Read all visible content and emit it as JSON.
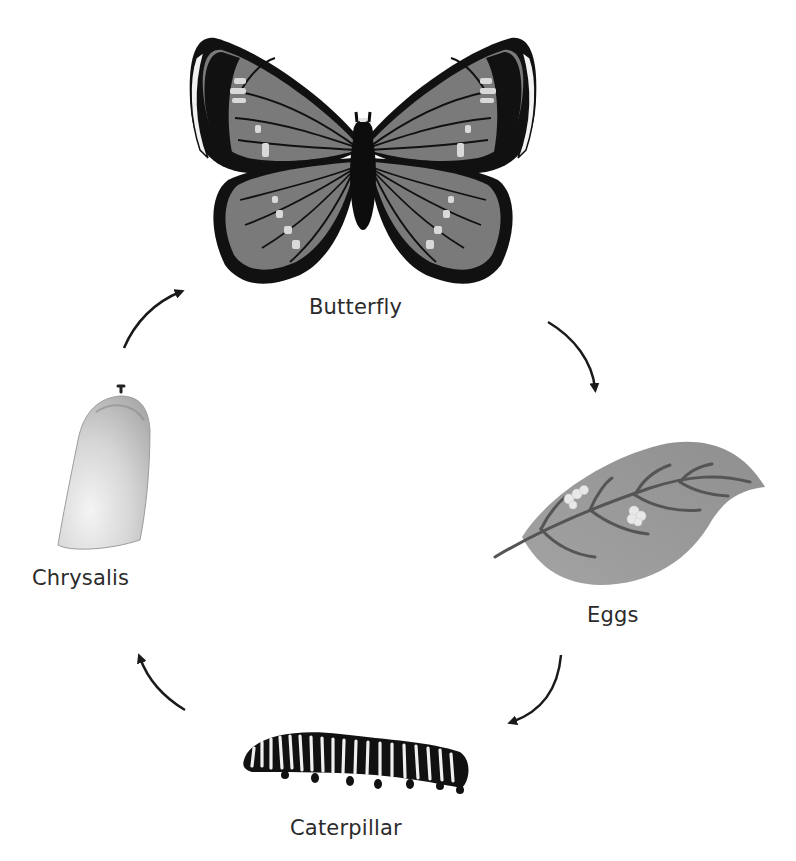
{
  "stages": [
    {
      "id": "butterfly",
      "label": "Butterfly"
    },
    {
      "id": "eggs",
      "label": "Eggs"
    },
    {
      "id": "caterpillar",
      "label": "Caterpillar"
    },
    {
      "id": "chrysalis",
      "label": "Chrysalis"
    }
  ],
  "arrows": [
    {
      "from": "butterfly",
      "to": "eggs",
      "direction": "clockwise"
    },
    {
      "from": "eggs",
      "to": "caterpillar",
      "direction": "clockwise"
    },
    {
      "from": "caterpillar",
      "to": "chrysalis",
      "direction": "clockwise"
    },
    {
      "from": "chrysalis",
      "to": "butterfly",
      "direction": "clockwise"
    }
  ],
  "colors": {
    "background": "#ffffff",
    "wing_fill": "#7a7a7a",
    "wing_dark": "#111111",
    "wing_spots": "#d9d9d9",
    "leaf_fill": "#9a9a9a",
    "leaf_veins": "#555555",
    "eggs": "#e6e6e6",
    "chrysalis": "#d8d8d8",
    "arrow": "#1a1a1a",
    "label_text": "#2b2b2b"
  }
}
